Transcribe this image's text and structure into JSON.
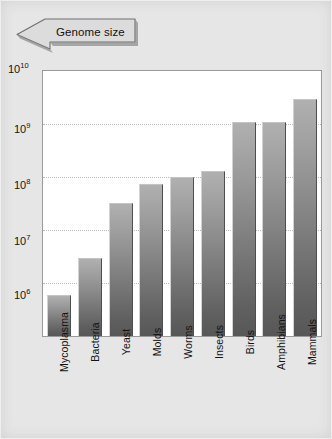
{
  "callout": {
    "label": "Genome size",
    "icon": "arrow-banner-icon"
  },
  "axis": {
    "yticks": [
      {
        "mantissa": "10",
        "exponent": "10"
      },
      {
        "mantissa": "10",
        "exponent": "9"
      },
      {
        "mantissa": "10",
        "exponent": "8"
      },
      {
        "mantissa": "10",
        "exponent": "7"
      },
      {
        "mantissa": "10",
        "exponent": "6"
      }
    ]
  },
  "chart_data": {
    "type": "bar",
    "title": "Genome size",
    "xlabel": "",
    "ylabel": "",
    "yscale": "log",
    "ylim": [
      100000,
      10000000000
    ],
    "grid": true,
    "legend": "none",
    "categories": [
      "Mycoplasma",
      "Bacteria",
      "Yeast",
      "Molds",
      "Worms",
      "Insects",
      "Birds",
      "Amphibians",
      "Mammals"
    ],
    "values": [
      600000,
      3000000,
      33000000,
      75000000,
      100000000,
      130000000,
      1100000000,
      1100000000,
      3000000000
    ],
    "value_labels": [
      "6×10⁵",
      "3×10⁶",
      "3.3×10⁷",
      "7.5×10⁷",
      "1×10⁸",
      "1.3×10⁸",
      "1.1×10⁹",
      "1.1×10⁹",
      "3×10⁹"
    ],
    "ytick_values": [
      10000000000,
      1000000000,
      100000000,
      10000000,
      1000000
    ],
    "ytick_labels": [
      "10^10",
      "10^9",
      "10^8",
      "10^7",
      "10^6"
    ],
    "colors": {
      "bar_top": "#b0b0b0",
      "bar_bottom": "#575757",
      "background": "#e6e6e6",
      "plot_background": "#ffffff",
      "gridline": "#b9b9b9",
      "frame": "#9a9a9a",
      "text": "#141414"
    }
  }
}
